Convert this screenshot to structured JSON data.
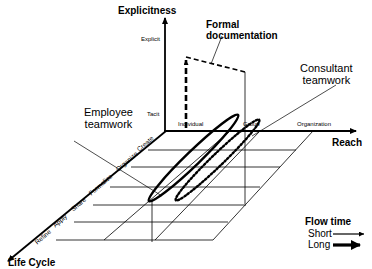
{
  "axes": {
    "explicitness": {
      "title": "Explicitness",
      "ticks": [
        "Explicit",
        "Tacit"
      ]
    },
    "reach": {
      "title": "Reach",
      "ticks": [
        "Individual",
        "Group",
        "Organization"
      ]
    },
    "life_cycle": {
      "title": "Life Cycle",
      "ticks": [
        "Create",
        "Organize",
        "Formalize",
        "Share",
        "Apply",
        "Refine"
      ]
    }
  },
  "annotations": {
    "formal_documentation": [
      "Formal",
      "documentation"
    ],
    "consultant_teamwork": [
      "Consultant",
      "teamwork"
    ],
    "employee_teamwork": [
      "Employee",
      "teamwork"
    ]
  },
  "legend": {
    "title": "Flow time",
    "items": [
      {
        "label": "Short",
        "style": "thin"
      },
      {
        "label": "Long",
        "style": "thick"
      }
    ]
  },
  "colors": {
    "ink": "#000000",
    "background": "#ffffff"
  }
}
